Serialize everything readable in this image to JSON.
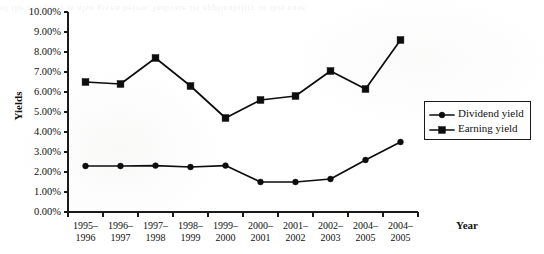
{
  "chart_data": {
    "type": "line",
    "title": "",
    "xlabel": "Year",
    "ylabel": "Yields",
    "ylim": [
      0,
      10
    ],
    "ytick_labels": [
      "0.00%",
      "1.00%",
      "2.00%",
      "3.00%",
      "4.00%",
      "5.00%",
      "6.00%",
      "7.00%",
      "8.00%",
      "9.00%",
      "10.00%"
    ],
    "ytick_values": [
      0,
      1,
      2,
      3,
      4,
      5,
      6,
      7,
      8,
      9,
      10
    ],
    "grid": false,
    "legend_position": "right",
    "categories": [
      "1995–1996",
      "1996–1997",
      "1997–1998",
      "1998–1999",
      "1999–2000",
      "2000–2001",
      "2001–2002",
      "2002–2003",
      "2004–2005",
      "2004–2005"
    ],
    "category_lines": [
      [
        "1995–",
        "1996"
      ],
      [
        "1996–",
        "1997"
      ],
      [
        "1997–",
        "1998"
      ],
      [
        "1998–",
        "1999"
      ],
      [
        "1999–",
        "2000"
      ],
      [
        "2000–",
        "2001"
      ],
      [
        "2001–",
        "2002"
      ],
      [
        "2002–",
        "2003"
      ],
      [
        "2004–",
        "2005"
      ],
      [
        "2004–",
        "2005"
      ]
    ],
    "series": [
      {
        "name": "Dividend yield",
        "marker": "circle",
        "values": [
          2.3,
          2.3,
          2.32,
          2.25,
          2.32,
          1.5,
          1.5,
          1.65,
          2.6,
          3.5
        ]
      },
      {
        "name": "Earning yield",
        "marker": "square",
        "values": [
          6.5,
          6.4,
          7.7,
          6.3,
          4.7,
          5.6,
          5.8,
          7.05,
          6.15,
          8.6
        ]
      }
    ]
  },
  "legend": {
    "items": [
      {
        "label": "Dividend yield",
        "marker": "circle"
      },
      {
        "label": "Earning yield",
        "marker": "square"
      }
    ]
  },
  "artifacts": {
    "bleed_through_text": "of the company is also given below. Indicate its applicability in this case."
  },
  "colors": {
    "ink": "#0d0d0d",
    "axis": "#1a1a1a",
    "paper": "#ffffff"
  }
}
